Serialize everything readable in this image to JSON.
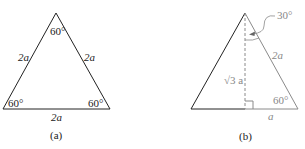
{
  "figure_a": {
    "caption": "(a)",
    "apex_angle": "60°",
    "bottom_left_angle": "60°",
    "bottom_right_angle": "60°",
    "left_side": "2a",
    "right_side": "2a",
    "base": "2a"
  },
  "figure_b": {
    "caption": "(b)",
    "apex_half_angle": "30°",
    "hypotenuse": "2a",
    "height": "√3 a",
    "base_angle": "60°",
    "half_base": "a"
  },
  "colors": {
    "primary_stroke": "#222222",
    "secondary_stroke": "#8a8a8a"
  }
}
